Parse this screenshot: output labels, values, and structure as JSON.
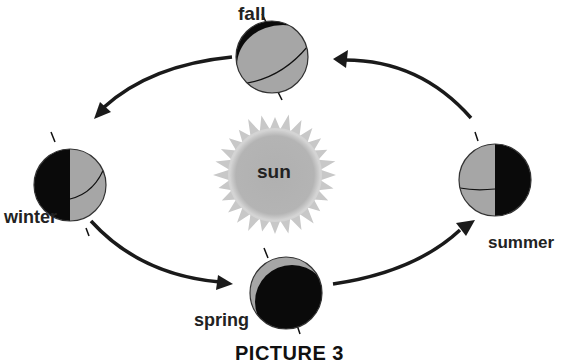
{
  "diagram": {
    "title": "PICTURE 3",
    "sun": {
      "label": "sun"
    },
    "seasons": [
      {
        "id": "fall",
        "label": "fall"
      },
      {
        "id": "winter",
        "label": "winter"
      },
      {
        "id": "summer",
        "label": "summer"
      },
      {
        "id": "spring",
        "label": "spring"
      }
    ],
    "orbit_direction": "counterclockwise",
    "colors": {
      "lit": "#a6a6a6",
      "dark": "#0a0a0a",
      "sun_core": "#b3b3b3",
      "sun_rays": "#c8c8c8",
      "arrow": "#1a1a1a"
    }
  }
}
